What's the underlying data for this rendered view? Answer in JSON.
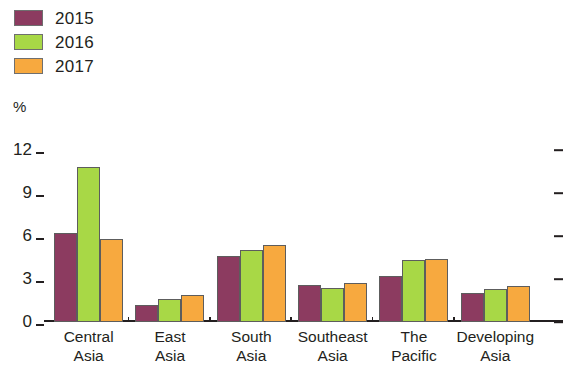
{
  "chart_data": {
    "type": "bar",
    "title": "",
    "subtitle": "",
    "xlabel": "",
    "ylabel": "%",
    "ylim": [
      0,
      12.7
    ],
    "yticks": [
      0,
      3,
      6,
      9,
      12
    ],
    "ytick_labels": [
      "0",
      "3",
      "6",
      "9",
      "12"
    ],
    "grid": false,
    "legend_position": "top-left",
    "categories": [
      "Central Asia",
      "East Asia",
      "South Asia",
      "Southeast Asia",
      "The Pacific",
      "Developing Asia"
    ],
    "category_lines": [
      [
        "Central",
        "Asia"
      ],
      [
        "East",
        "Asia"
      ],
      [
        "South",
        "Asia"
      ],
      [
        "Southeast",
        "Asia"
      ],
      [
        "The",
        "Pacific"
      ],
      [
        "Developing",
        "Asia"
      ]
    ],
    "series": [
      {
        "name": "2015",
        "color": "#8C3B60",
        "values": [
          6.2,
          1.2,
          4.6,
          2.6,
          3.2,
          2.0
        ]
      },
      {
        "name": "2016",
        "color": "#A8D846",
        "values": [
          10.8,
          1.6,
          5.0,
          2.4,
          4.3,
          2.3
        ]
      },
      {
        "name": "2017",
        "color": "#F7A93F",
        "values": [
          5.8,
          1.9,
          5.4,
          2.7,
          4.4,
          2.5
        ]
      }
    ]
  },
  "legend": {
    "items": [
      {
        "label": "2015",
        "color": "#8C3B60"
      },
      {
        "label": "2016",
        "color": "#A8D846"
      },
      {
        "label": "2017",
        "color": "#F7A93F"
      }
    ]
  },
  "axis": {
    "unit_label": "%"
  }
}
